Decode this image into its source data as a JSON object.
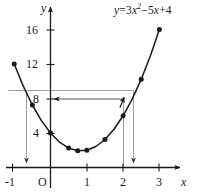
{
  "figure": {
    "equation_label": "y = 3x2 − 5x + 4",
    "equation_parts": {
      "lhs": "y",
      "eq": "=",
      "coef_a": "3",
      "var": "x",
      "power": "2",
      "minus": "−",
      "coef_b": "5",
      "var2": "x",
      "plus": "+",
      "coef_c": "4"
    },
    "x_axis": {
      "name": "x",
      "ticks": [
        "-1",
        "1",
        "2",
        "3"
      ],
      "tick_values": [
        -1,
        1,
        2,
        3
      ],
      "origin_label": "O",
      "range": [
        -1.35,
        3.6
      ]
    },
    "y_axis": {
      "name": "y",
      "ticks": [
        "4",
        "8",
        "12",
        "16"
      ],
      "tick_values": [
        4,
        8,
        12,
        16
      ],
      "range": [
        -1.2,
        18.2
      ]
    }
  },
  "chart_data": {
    "type": "line",
    "title": "",
    "subtitle": "",
    "xlabel": "x",
    "ylabel": "y",
    "xlim": [
      -1.35,
      3.6
    ],
    "ylim": [
      -1.2,
      18.2
    ],
    "grid": false,
    "legend": null,
    "annotations": [
      {
        "name": "equation",
        "text": "y = 3x² − 5x + 4",
        "x": 2.3,
        "y": 17.4
      }
    ],
    "series": [
      {
        "name": "y = 3x^2 - 5x + 4",
        "type": "line",
        "marker": "filled-circle",
        "x": [
          -1,
          -0.75,
          -0.5,
          -0.25,
          0,
          0.25,
          0.5,
          0.75,
          1,
          1.25,
          1.5,
          1.75,
          2,
          2.25,
          2.5,
          2.75,
          3
        ],
        "y": [
          12,
          9.4375,
          7.25,
          5.4375,
          4,
          2.9375,
          2.25,
          1.9375,
          2,
          2.4375,
          3.25,
          4.4375,
          6,
          7.9375,
          10.25,
          12.9375,
          16
        ],
        "plotted_points_x": [
          -1,
          -0.5,
          0,
          0.5,
          0.75,
          1,
          1.5,
          2,
          2.5,
          3
        ],
        "plotted_points_y": [
          12,
          7.25,
          4,
          2.25,
          1.9375,
          2,
          3.25,
          6,
          10.25,
          16
        ]
      }
    ],
    "construction_lines": [
      {
        "name": "upper-horizontal-guide",
        "orientation": "horizontal",
        "y": 9.4,
        "x_from": -1.35,
        "x_to": 2.35,
        "arrow": "none",
        "color": "#9a9a9a"
      },
      {
        "name": "y-equals-8-arrow",
        "orientation": "horizontal",
        "y": 8,
        "x_from": 2.2,
        "x_to": -0.05,
        "arrow": "left",
        "color": "#555555"
      },
      {
        "name": "left-drop-line",
        "orientation": "vertical",
        "x": -0.62,
        "y_from": 9.4,
        "y_to": 0,
        "arrow": "down",
        "color": "#9a9a9a"
      },
      {
        "name": "right-drop-line-inner",
        "orientation": "vertical",
        "x": 2.2,
        "y_from": 8,
        "y_to": 0,
        "arrow": "none",
        "color": "#9a9a9a"
      },
      {
        "name": "right-drop-line-outer",
        "orientation": "vertical",
        "x": 2.35,
        "y_from": 9.4,
        "y_to": 0,
        "arrow": "down",
        "color": "#9a9a9a"
      },
      {
        "name": "curve-intersection-arrow",
        "orientation": "up-arrowhead",
        "x": 2.2,
        "y": 8,
        "arrow": "up",
        "color": "#1a1a1a"
      }
    ]
  }
}
